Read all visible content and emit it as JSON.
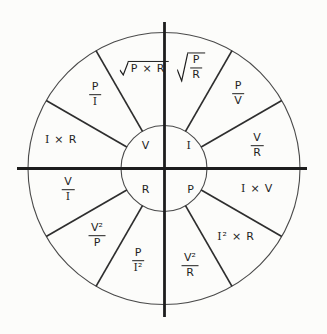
{
  "diagram": {
    "colors": {
      "background": "#fcfcfa",
      "axis_line": "#1d1d1d",
      "divider_line": "#2e2e2e",
      "circle_line": "#4a4a4a",
      "text": "#1f1f1f"
    },
    "center_quantities": [
      {
        "id": "V",
        "quadrant": "top-left",
        "formula": {
          "kind": "text",
          "text": "V"
        }
      },
      {
        "id": "I",
        "quadrant": "top-right",
        "formula": {
          "kind": "text",
          "text": "I"
        }
      },
      {
        "id": "R",
        "quadrant": "bottom-left",
        "formula": {
          "kind": "text",
          "text": "R"
        }
      },
      {
        "id": "P",
        "quadrant": "bottom-right",
        "formula": {
          "kind": "text",
          "text": "P"
        }
      }
    ],
    "sectors": [
      {
        "id": "sqrt-p-times-r",
        "quadrant": "V",
        "formula": {
          "kind": "sqrt",
          "arg": {
            "kind": "text",
            "text": "P × R"
          }
        }
      },
      {
        "id": "sqrt-p-over-r",
        "quadrant": "I",
        "formula": {
          "kind": "sqrt",
          "arg": {
            "kind": "fraction",
            "num": "P",
            "den": "R"
          }
        }
      },
      {
        "id": "p-over-i",
        "quadrant": "V",
        "formula": {
          "kind": "fraction",
          "num": "P",
          "den": "I"
        }
      },
      {
        "id": "p-over-v",
        "quadrant": "I",
        "formula": {
          "kind": "fraction",
          "num": "P",
          "den": "V"
        }
      },
      {
        "id": "i-times-r",
        "quadrant": "V",
        "formula": {
          "kind": "text",
          "text": "I × R"
        }
      },
      {
        "id": "v-over-r",
        "quadrant": "I",
        "formula": {
          "kind": "fraction",
          "num": "V",
          "den": "R"
        }
      },
      {
        "id": "v-over-i",
        "quadrant": "R",
        "formula": {
          "kind": "fraction",
          "num": "V",
          "den": "I"
        }
      },
      {
        "id": "i-times-v",
        "quadrant": "P",
        "formula": {
          "kind": "text",
          "text": "I × V"
        }
      },
      {
        "id": "v2-over-p",
        "quadrant": "R",
        "formula": {
          "kind": "fraction",
          "num": "V²",
          "den": "P"
        }
      },
      {
        "id": "i2-times-r",
        "quadrant": "P",
        "formula": {
          "kind": "text",
          "text": "I² × R"
        }
      },
      {
        "id": "p-over-i2",
        "quadrant": "R",
        "formula": {
          "kind": "fraction",
          "num": "P",
          "den": "I²"
        }
      },
      {
        "id": "v2-over-r",
        "quadrant": "P",
        "formula": {
          "kind": "fraction",
          "num": "V²",
          "den": "R"
        }
      }
    ]
  }
}
